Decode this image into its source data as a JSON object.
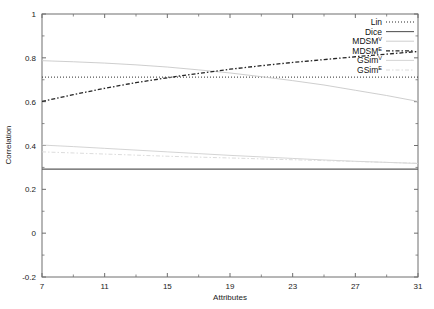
{
  "chart_data": {
    "type": "line",
    "title": "",
    "xlabel": "Attributes",
    "ylabel": "Correlation",
    "xlim": [
      7,
      31
    ],
    "ylim": [
      -0.2,
      1
    ],
    "xticks": [
      7,
      11,
      15,
      19,
      23,
      27,
      31
    ],
    "yticks": [
      -0.2,
      0,
      0.2,
      0.4,
      0.6,
      0.8,
      1
    ],
    "grid": false,
    "legend_position": "top-right",
    "x": [
      7,
      9,
      11,
      13,
      15,
      17,
      19,
      21,
      23,
      25,
      27,
      29,
      31
    ],
    "series": [
      {
        "name": "Lin",
        "label": "Lin",
        "superscript": "",
        "style": "dotted",
        "color": "#2b2b2b",
        "values": [
          0.712,
          0.712,
          0.712,
          0.712,
          0.712,
          0.712,
          0.712,
          0.712,
          0.712,
          0.712,
          0.712,
          0.712,
          0.712
        ]
      },
      {
        "name": "Dice",
        "label": "Dice",
        "superscript": "",
        "style": "solid",
        "color": "#5a5a5a",
        "values": [
          0.292,
          0.292,
          0.292,
          0.292,
          0.292,
          0.292,
          0.292,
          0.292,
          0.292,
          0.292,
          0.292,
          0.292,
          0.292
        ]
      },
      {
        "name": "MDSM-V",
        "label": "MDSM",
        "superscript": "V",
        "style": "solid-light",
        "color": "#c8c8c8",
        "values": [
          0.787,
          0.782,
          0.776,
          0.768,
          0.758,
          0.745,
          0.731,
          0.714,
          0.696,
          0.676,
          0.652,
          0.628,
          0.601
        ]
      },
      {
        "name": "MDSM-E",
        "label": "MDSM",
        "superscript": "E",
        "style": "dashdot",
        "color": "#242424",
        "values": [
          0.601,
          0.632,
          0.661,
          0.687,
          0.709,
          0.729,
          0.748,
          0.764,
          0.779,
          0.792,
          0.805,
          0.817,
          0.829
        ]
      },
      {
        "name": "GSim-V",
        "label": "GSim",
        "superscript": "V",
        "style": "solid-light",
        "color": "#cfcfcf",
        "values": [
          0.402,
          0.395,
          0.387,
          0.379,
          0.371,
          0.363,
          0.355,
          0.348,
          0.341,
          0.334,
          0.328,
          0.323,
          0.318
        ]
      },
      {
        "name": "GSim-E",
        "label": "GSim",
        "superscript": "E",
        "style": "dashdot-light",
        "color": "#d8d8d8",
        "values": [
          0.371,
          0.366,
          0.361,
          0.356,
          0.351,
          0.347,
          0.343,
          0.339,
          0.335,
          0.331,
          0.327,
          0.323,
          0.319
        ]
      }
    ]
  },
  "axes": {
    "x_tick_labels": [
      "7",
      "11",
      "15",
      "19",
      "23",
      "27",
      "31"
    ],
    "y_tick_labels": [
      "-0.2",
      "0",
      "0.2",
      "0.4",
      "0.6",
      "0.8",
      "1"
    ],
    "x_title": "Attributes",
    "y_title": "Correlation"
  },
  "legend": {
    "entries": [
      {
        "label": "Lin",
        "superscript": ""
      },
      {
        "label": "Dice",
        "superscript": ""
      },
      {
        "label": "MDSM",
        "superscript": "V"
      },
      {
        "label": "MDSM",
        "superscript": "E"
      },
      {
        "label": "GSim",
        "superscript": "V"
      },
      {
        "label": "GSim",
        "superscript": "E"
      }
    ]
  },
  "colors": {
    "axis": "#6e6e6e",
    "text": "#1a1a1a",
    "background": "#ffffff"
  }
}
